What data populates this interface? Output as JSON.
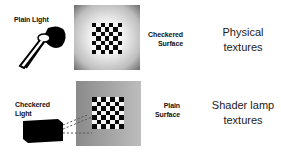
{
  "rows": [
    {
      "light_label": "Plain Light",
      "surface_label_lines": [
        "Checkered",
        "Surface"
      ],
      "caption_lines": [
        "Physical",
        "textures"
      ]
    },
    {
      "light_label_lines": [
        "Checkered",
        "Light"
      ],
      "surface_label_lines": [
        "Plain",
        "Surface"
      ],
      "caption_lines": [
        "Shader lamp",
        "textures"
      ]
    }
  ],
  "checker": {
    "cols": 7,
    "rows": 7,
    "dark": "#0a0a0a",
    "light": "#f4f4f4"
  }
}
